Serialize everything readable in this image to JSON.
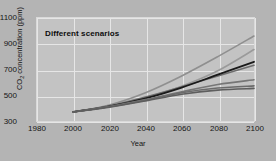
{
  "figure": {
    "title": "Different scenarios",
    "background_color": "#b4b4b4",
    "plot_background_color": "#c3c3c3",
    "grid_color": "#e6e6e6"
  },
  "axes": {
    "xlabel": "Year",
    "ylabel_main": "CO",
    "ylabel_sub": "2",
    "ylabel_rest": " concentration (ppm)",
    "ylabel_full": "CO2 concentration (ppm)",
    "yticks": [
      "1100",
      "900",
      "700",
      "500",
      "300"
    ],
    "xticks": [
      "1980",
      "2000",
      "2020",
      "2040",
      "2060",
      "2080",
      "2100"
    ]
  },
  "chart_data": {
    "type": "line",
    "title": "Different scenarios",
    "xlabel": "Year",
    "ylabel": "CO2 concentration (ppm)",
    "xlim": [
      1980,
      2100
    ],
    "ylim": [
      300,
      1100
    ],
    "xticks": [
      1980,
      2000,
      2020,
      2040,
      2060,
      2080,
      2100
    ],
    "yticks": [
      300,
      500,
      700,
      900,
      1100
    ],
    "grid": true,
    "legend": "none",
    "x": [
      2000,
      2020,
      2040,
      2060,
      2080,
      2100
    ],
    "series": [
      {
        "name": "scenario-a1fi",
        "color": "#8f8f8f",
        "width": 1.6,
        "values": [
          370,
          425,
          520,
          650,
          800,
          960
        ]
      },
      {
        "name": "scenario-a2",
        "color": "#9a9a9a",
        "width": 1.6,
        "values": [
          370,
          415,
          480,
          570,
          690,
          855
        ]
      },
      {
        "name": "scenario-a1b",
        "color": "#6e6e6e",
        "width": 1.6,
        "values": [
          370,
          418,
          486,
          566,
          650,
          733
        ]
      },
      {
        "name": "scenario-is92a",
        "color": "#1a1a1a",
        "width": 1.8,
        "values": [
          370,
          414,
          476,
          560,
          660,
          760
        ]
      },
      {
        "name": "scenario-b2",
        "color": "#767676",
        "width": 1.6,
        "values": [
          370,
          412,
          466,
          527,
          583,
          620
        ]
      },
      {
        "name": "scenario-a1t",
        "color": "#6b6b6b",
        "width": 1.6,
        "values": [
          370,
          410,
          462,
          520,
          556,
          573
        ]
      },
      {
        "name": "scenario-b1",
        "color": "#5e5e5e",
        "width": 1.6,
        "values": [
          370,
          408,
          456,
          508,
          540,
          553
        ]
      }
    ]
  }
}
